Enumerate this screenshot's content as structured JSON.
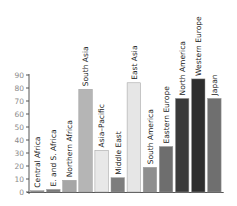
{
  "chart_data": {
    "type": "bar",
    "title": "",
    "xlabel": "",
    "ylabel": "",
    "ylim": [
      0,
      90
    ],
    "yticks": [
      0,
      10,
      20,
      30,
      40,
      50,
      60,
      70,
      80,
      90
    ],
    "grid": false,
    "legend": null,
    "categories": [
      "Central Africa",
      "E. and S. Africa",
      "Northern Africa",
      "South Asia",
      "Asia–Pacific",
      "Middle East",
      "East Asia",
      "South America",
      "Eastern Europe",
      "North America",
      "Western Europe",
      "Japan"
    ],
    "values": [
      1,
      2,
      9,
      79,
      32,
      11,
      84,
      19,
      35,
      72,
      87,
      72
    ],
    "bar_colors": [
      "#8c8c8c",
      "#7a7a7a",
      "#a6a6a6",
      "#b5b5b5",
      "#e8e8e8",
      "#7d7d7d",
      "#e6e6e6",
      "#8f8f8f",
      "#6e6e6e",
      "#3a3a3a",
      "#2e2e2e",
      "#6f6f6f"
    ],
    "label_placement": "rotated vertical text above each bar"
  }
}
